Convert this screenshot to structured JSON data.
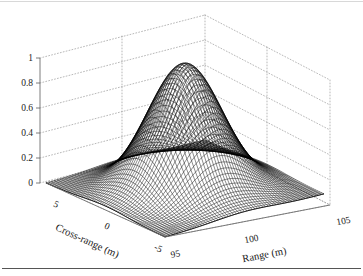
{
  "figure": {
    "background_color": "#ffffff",
    "mesh_color": "#000000",
    "grid_color": "#9a9a9a",
    "axis_color": "#6e6e6e"
  },
  "chart_data": {
    "type": "surface",
    "title": "",
    "subtitle": "",
    "xlabel": "Range (m)",
    "ylabel": "Cross-range (m)",
    "zlabel": "",
    "xlim": [
      95,
      105
    ],
    "ylim": [
      -5,
      5
    ],
    "zlim": [
      0,
      1
    ],
    "xticks": [
      95,
      100,
      105
    ],
    "xticklabels": [
      "95",
      "100",
      "105"
    ],
    "yticks": [
      5,
      0,
      -5
    ],
    "yticklabels": [
      "5",
      "0",
      "-5"
    ],
    "zticks": [
      0,
      0.2,
      0.4,
      0.6,
      0.8,
      1
    ],
    "zticklabels": [
      "0",
      "0.2",
      "0.4",
      "0.6",
      "0.8",
      "1"
    ],
    "grid": true,
    "legend": false,
    "legend_position": "none",
    "view": {
      "azimuth": -37.5,
      "elevation": 30
    },
    "surface_style": "mesh-wireframe-black",
    "annotation": "Two-dimensional Gaussian point-spread response peaking at amplitude 1.0 near Range = 100 m, Cross-range = 0 m",
    "peak": {
      "x": 100,
      "y": 0,
      "z": 1.0
    },
    "function": "z = exp(-((x-100)^2)/(2*1.9^2) - (y^2)/(2*1.9^2))",
    "sigma_x": 1.9,
    "sigma_y": 1.9,
    "grid_samples": {
      "nx": 61,
      "ny": 61
    }
  },
  "axes": {
    "z_ticks": [
      "1",
      "0.8",
      "0.6",
      "0.4",
      "0.2",
      "0"
    ],
    "x_ticks": [
      "95",
      "100",
      "105"
    ],
    "y_ticks": [
      "5",
      "0",
      "-5"
    ],
    "x_title": "Range (m)",
    "y_title": "Cross-range (m)"
  }
}
